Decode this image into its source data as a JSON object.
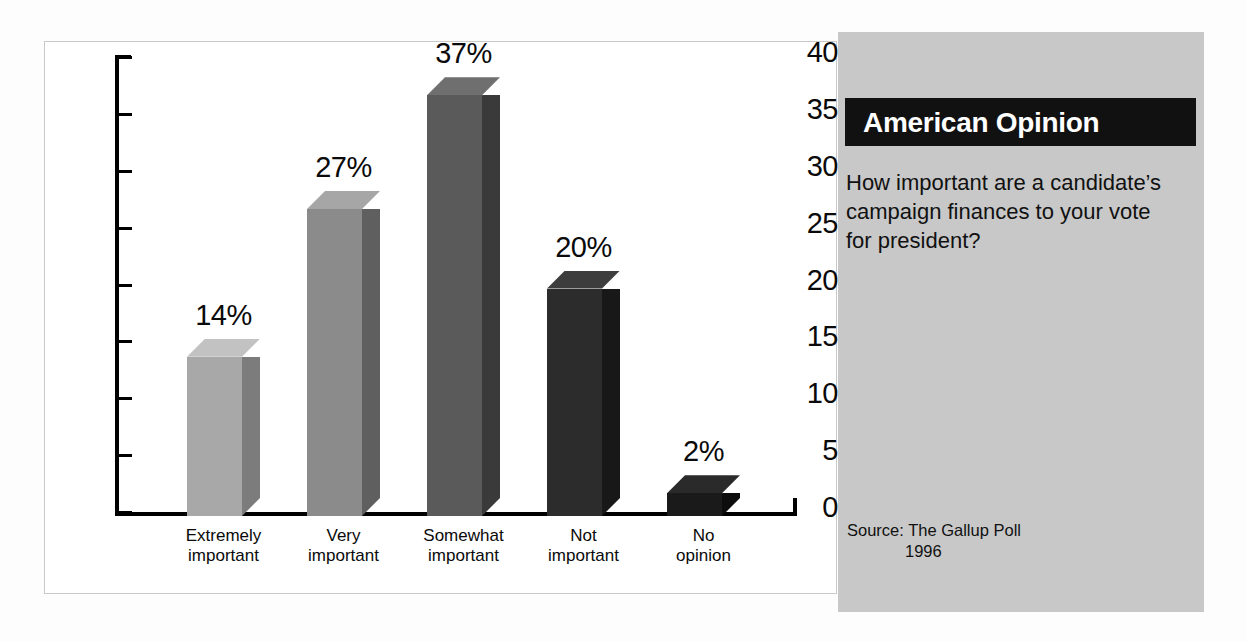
{
  "chart_data": {
    "type": "bar",
    "title": "",
    "subtitle": "",
    "xlabel": "",
    "ylabel": "",
    "ylim": [
      0,
      40
    ],
    "ytick_step": 5,
    "yticks": [
      "40",
      "35",
      "30",
      "25",
      "20",
      "15",
      "10",
      "5",
      "0"
    ],
    "grid": false,
    "legend": "none",
    "style": "3d-bar",
    "categories": [
      "Extremely important",
      "Very important",
      "Somewhat important",
      "Not important",
      "No opinion"
    ],
    "category_lines": [
      [
        "Extremely",
        "important"
      ],
      [
        "Very",
        "important"
      ],
      [
        "Somewhat",
        "important"
      ],
      [
        "Not",
        "important"
      ],
      [
        "No",
        "opinion"
      ]
    ],
    "values": [
      14,
      27,
      37,
      20,
      2
    ],
    "value_labels": [
      "14%",
      "27%",
      "37%",
      "20%",
      "2%"
    ],
    "bar_colors": [
      {
        "front": "#a8a8a8",
        "side": "#7c7c7c",
        "top": "#c2c2c2"
      },
      {
        "front": "#8b8b8b",
        "side": "#5f5f5f",
        "top": "#a6a6a6"
      },
      {
        "front": "#5a5a5a",
        "side": "#3a3a3a",
        "top": "#6f6f6f"
      },
      {
        "front": "#2c2c2c",
        "side": "#181818",
        "top": "#3d3d3d"
      },
      {
        "front": "#1a1a1a",
        "side": "#0d0d0d",
        "top": "#2a2a2a"
      }
    ]
  },
  "sidebar": {
    "header_title": "American Opinion",
    "header_bg": "#111111",
    "panel_bg": "#c8c8c8",
    "question": "How important are a candidate’s campaign finances to your vote for president?",
    "source_label": "Source:  The Gallup Poll",
    "source_year": "1996"
  }
}
